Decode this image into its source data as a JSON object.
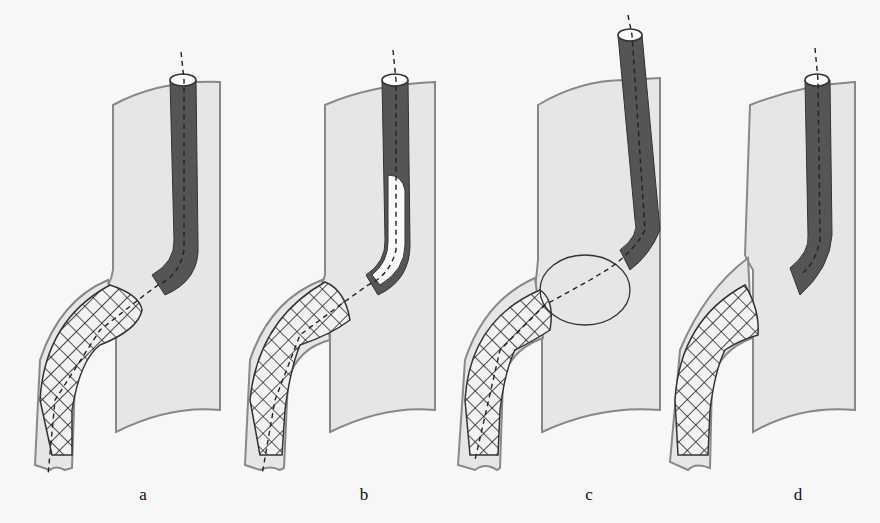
{
  "figure": {
    "panels": [
      {
        "id": "a",
        "label": "a",
        "x": 143,
        "description": "Catheter with snare wire passing through stent; stent end protrudes into main vessel"
      },
      {
        "id": "b",
        "label": "b",
        "x": 364,
        "description": "Snare wire grips protruding stent end; inner sheath advanced (white dashed section)"
      },
      {
        "id": "c",
        "label": "c",
        "x": 589,
        "description": "Snare loop opened around protruding stent end, pulling toward catheter"
      },
      {
        "id": "d",
        "label": "d",
        "x": 798,
        "description": "Stent repositioned in branch; catheter withdrawn"
      }
    ],
    "colors": {
      "background": "#f7f7f7",
      "vessel_fill": "#e6e6e6",
      "vessel_outline": "#888888",
      "catheter": "#555555",
      "mesh": "#222222",
      "label_text": "#111111"
    }
  }
}
